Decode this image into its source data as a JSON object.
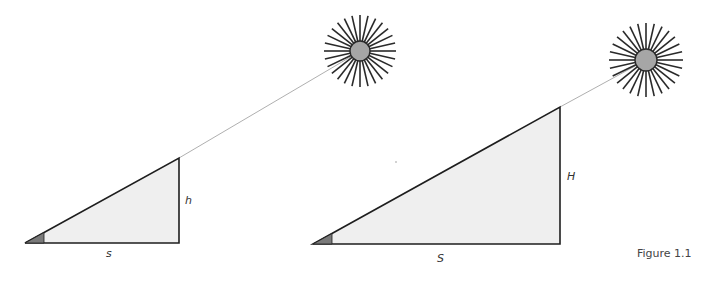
{
  "figure": {
    "caption": "Figure 1.1",
    "colors": {
      "triangle_fill": "#efefef",
      "triangle_stroke": "#1e1e1e",
      "angle_fill": "#7a7a7a",
      "sun_fill": "#a6a6a6",
      "sun_ray": "#2a2a2a",
      "sight_line": "#9a9a9a"
    },
    "diagrams": [
      {
        "name": "small-triangle",
        "base_label": "s",
        "height_label": "h"
      },
      {
        "name": "large-triangle",
        "base_label": "S",
        "height_label": "H"
      }
    ]
  }
}
